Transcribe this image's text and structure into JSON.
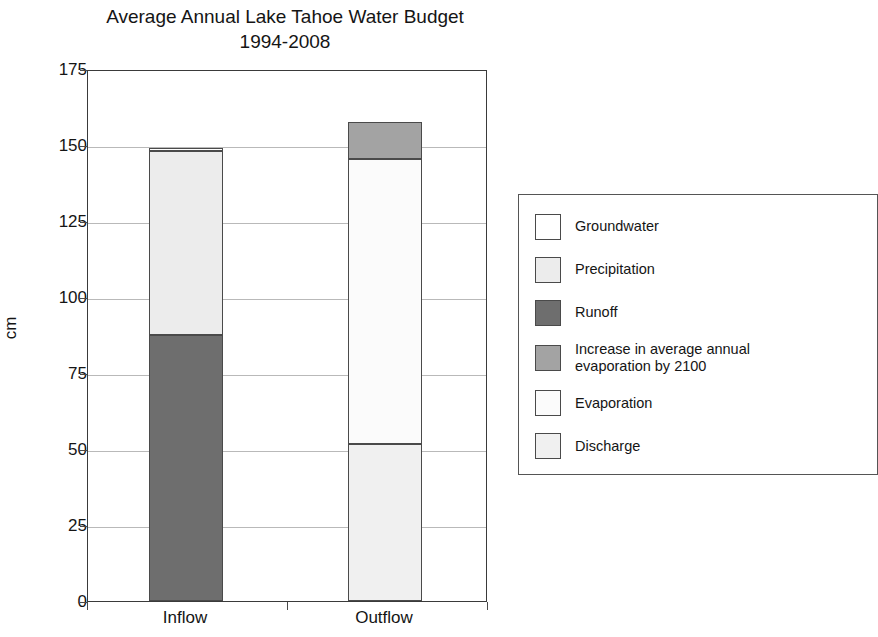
{
  "chart_data": {
    "type": "bar",
    "subtype": "stacked-bar",
    "title": "Average Annual Lake Tahoe Water Budget\n1994-2008",
    "xlabel": "",
    "ylabel": "cm",
    "ylim": [
      0,
      175
    ],
    "yticks": [
      0,
      25,
      50,
      75,
      100,
      125,
      150,
      175
    ],
    "ytick_labels": [
      "0",
      "25",
      "50",
      "75",
      "100",
      "125",
      "150",
      "175"
    ],
    "grid": true,
    "grid_axis": "y",
    "legend_position": "right",
    "categories": [
      "Inflow",
      "Outflow"
    ],
    "series": [
      {
        "name": "Groundwater",
        "values": [
          1,
          0
        ],
        "color": "#ffffff"
      },
      {
        "name": "Precipitation",
        "values": [
          60.5,
          0
        ],
        "color": "#ececec"
      },
      {
        "name": "Runoff",
        "values": [
          87.5,
          0
        ],
        "color": "#6e6e6e"
      },
      {
        "name": "Increase in average annual evaporation by 2100",
        "values": [
          0,
          12
        ],
        "color": "#a3a3a3"
      },
      {
        "name": "Evaporation",
        "values": [
          0,
          94
        ],
        "color": "#fbfbfb"
      },
      {
        "name": "Discharge",
        "values": [
          0,
          51.5
        ],
        "color": "#f0f0f0"
      }
    ],
    "totals": {
      "Inflow": 149,
      "Outflow": 157.5
    },
    "stacks": {
      "Inflow": [
        {
          "name": "Runoff",
          "start": 0,
          "end": 87.5,
          "value": 87.5,
          "color": "#6e6e6e"
        },
        {
          "name": "Precipitation",
          "start": 87.5,
          "end": 148,
          "value": 60.5,
          "color": "#ececec"
        },
        {
          "name": "Groundwater",
          "start": 148,
          "end": 149,
          "value": 1,
          "color": "#ffffff"
        }
      ],
      "Outflow": [
        {
          "name": "Discharge",
          "start": 0,
          "end": 51.5,
          "value": 51.5,
          "color": "#f0f0f0"
        },
        {
          "name": "Evaporation",
          "start": 51.5,
          "end": 145.5,
          "value": 94,
          "color": "#fbfbfb"
        },
        {
          "name": "Increase in average annual evaporation by 2100",
          "start": 145.5,
          "end": 157.5,
          "value": 12,
          "color": "#a3a3a3"
        }
      ]
    },
    "legend": [
      {
        "label": "Groundwater",
        "color": "#ffffff"
      },
      {
        "label": "Precipitation",
        "color": "#ececec"
      },
      {
        "label": "Runoff",
        "color": "#6e6e6e"
      },
      {
        "label": "Increase in average annual\nevaporation by 2100",
        "color": "#a3a3a3"
      },
      {
        "label": "Evaporation",
        "color": "#fbfbfb"
      },
      {
        "label": "Discharge",
        "color": "#f0f0f0"
      }
    ]
  }
}
